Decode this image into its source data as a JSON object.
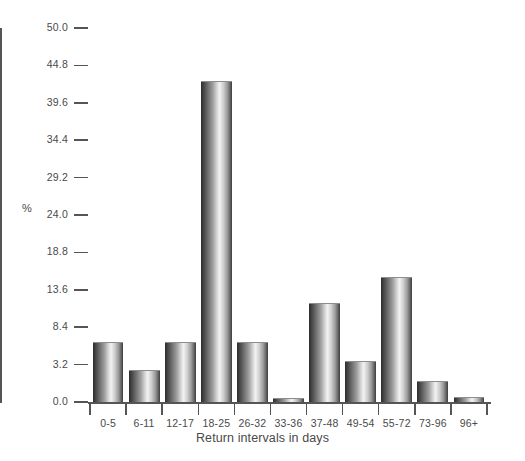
{
  "chart_data": {
    "type": "bar",
    "title": "",
    "xlabel": "Return intervals in days",
    "ylabel": "%",
    "categories": [
      "0-5",
      "6-11",
      "12-17",
      "18-25",
      "26-32",
      "33-36",
      "37-48",
      "49-54",
      "55-72",
      "73-96",
      "96+"
    ],
    "values": [
      6.3,
      2.7,
      6.3,
      42.6,
      6.3,
      0.3,
      11.8,
      3.7,
      15.4,
      1.8,
      0.4
    ],
    "ylim": [
      0.0,
      50.0
    ],
    "yticks": [
      0.0,
      3.2,
      8.4,
      13.6,
      18.8,
      24.0,
      29.2,
      34.4,
      39.6,
      44.8,
      50.0
    ],
    "ytick_labels": [
      "0.0",
      "3.2",
      "8.4",
      "13.6",
      "18.8",
      "24.0",
      "29.2",
      "34.4",
      "39.6",
      "44.8",
      "50.0"
    ],
    "grid": false,
    "legend": false,
    "bar_fill": "grayscale-gradient",
    "axis_color": "#555555",
    "text_color": "#4a4a4a"
  }
}
